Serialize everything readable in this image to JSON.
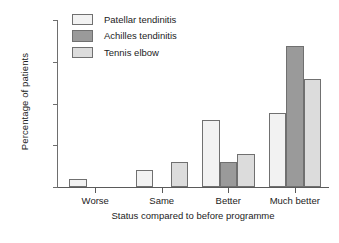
{
  "chart_data": {
    "type": "bar",
    "title": "",
    "xlabel": "Status compared to before programme",
    "ylabel": "Percentage of patients",
    "categories": [
      "Worse",
      "Same",
      "Better",
      "Much better"
    ],
    "series": [
      {
        "name": "Patellar tendinitis",
        "color": "#f2f2f2",
        "values": [
          5,
          10,
          40,
          44.5
        ]
      },
      {
        "name": "Achilles tendinitis",
        "color": "#9a9a9a",
        "values": [
          0,
          0,
          15,
          84.5
        ]
      },
      {
        "name": "Tennis elbow",
        "color": "#dcdcdc",
        "values": [
          0,
          15,
          19.5,
          64.5
        ]
      }
    ],
    "ylim": [
      0,
      100
    ],
    "yticks": [
      0,
      25,
      50,
      75,
      100
    ],
    "ytick_labels": [
      "0",
      "25",
      "50",
      "75",
      "100"
    ],
    "grid": false,
    "legend_position": "top-left-inside",
    "bar_edge_color": "#707070",
    "axis_color": "#5a5a5a",
    "background": "#ffffff"
  }
}
